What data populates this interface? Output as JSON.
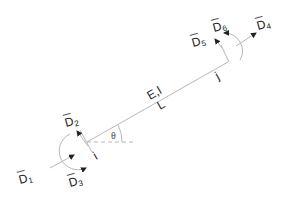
{
  "diagram": {
    "title": "",
    "element": {
      "properties_label": "E,I",
      "length_label": "L",
      "angle_label": "θ",
      "start_node_label": "i",
      "end_node_label": "j"
    },
    "dofs": [
      {
        "id": "D1",
        "letter": "D",
        "index": "1",
        "node": "i",
        "kind": "axial"
      },
      {
        "id": "D2",
        "letter": "D",
        "index": "2",
        "node": "i",
        "kind": "transverse"
      },
      {
        "id": "D3",
        "letter": "D",
        "index": "3",
        "node": "i",
        "kind": "rotation"
      },
      {
        "id": "D4",
        "letter": "D",
        "index": "4",
        "node": "j",
        "kind": "axial"
      },
      {
        "id": "D5",
        "letter": "D",
        "index": "5",
        "node": "j",
        "kind": "transverse"
      },
      {
        "id": "D6",
        "letter": "D",
        "index": "6",
        "node": "j",
        "kind": "rotation"
      }
    ]
  }
}
